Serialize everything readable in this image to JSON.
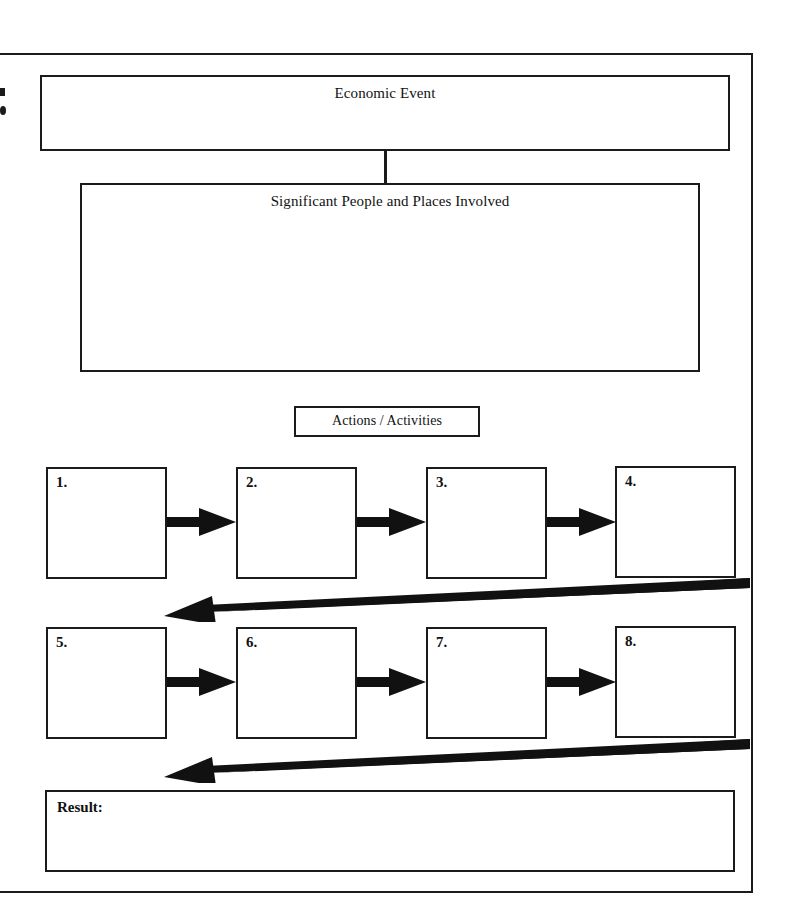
{
  "document": {
    "title": "Economic Event Graphic Organizer",
    "page_background": "#ffffff",
    "ink_color": "#1b1b1b"
  },
  "organizer": {
    "economic_event": {
      "title": "Economic Event",
      "body_text": ""
    },
    "people_places": {
      "title": "Significant People and Places Involved",
      "body_text": ""
    },
    "actions_header": {
      "title": "Actions / Activities"
    },
    "steps": [
      {
        "label": "1.",
        "body_text": ""
      },
      {
        "label": "2.",
        "body_text": ""
      },
      {
        "label": "3.",
        "body_text": ""
      },
      {
        "label": "4.",
        "body_text": ""
      },
      {
        "label": "5.",
        "body_text": ""
      },
      {
        "label": "6.",
        "body_text": ""
      },
      {
        "label": "7.",
        "body_text": ""
      },
      {
        "label": "8.",
        "body_text": ""
      }
    ],
    "result": {
      "label": "Result:",
      "body_text": ""
    },
    "flow_arrows": {
      "step_arrow_name": "arrow-right-icon",
      "wrap_arrow_name": "arrow-wrap-left-icon",
      "connector_name": "vertical-connector"
    }
  }
}
